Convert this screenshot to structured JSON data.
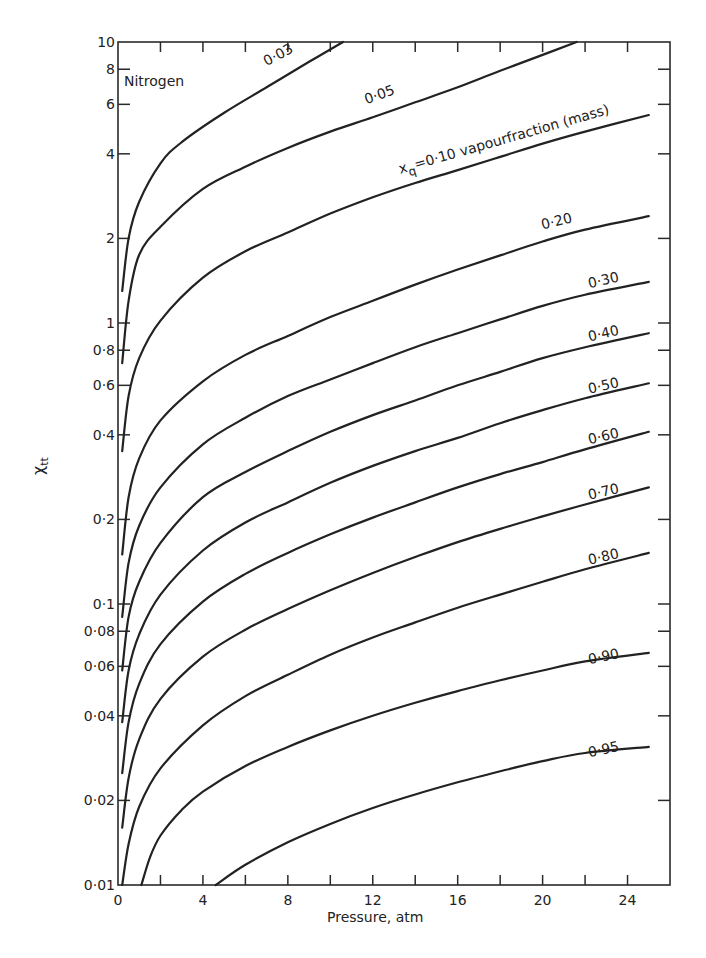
{
  "chart_data": {
    "type": "line",
    "title": "",
    "annotation": "Nitrogen",
    "xlabel": "Pressure, atm",
    "ylabel": "χtt",
    "ylabel_main": "χ",
    "ylabel_sub": "tt",
    "xscale": "linear",
    "yscale": "log",
    "xlim": [
      0,
      26
    ],
    "ylim": [
      0.01,
      10
    ],
    "grid": false,
    "legend_position": "inline labels at curve ends",
    "x_ticks": [
      0,
      2,
      4,
      6,
      8,
      10,
      12,
      14,
      16,
      18,
      20,
      22,
      24
    ],
    "x_tick_labels": [
      {
        "value": 0,
        "label": "0"
      },
      {
        "value": 4,
        "label": "4"
      },
      {
        "value": 8,
        "label": "8"
      },
      {
        "value": 12,
        "label": "12"
      },
      {
        "value": 16,
        "label": "16"
      },
      {
        "value": 20,
        "label": "20"
      },
      {
        "value": 24,
        "label": "24"
      }
    ],
    "y_ticks": [
      0.02,
      0.04,
      0.06,
      0.08,
      0.1,
      0.2,
      0.4,
      0.6,
      0.8,
      1,
      2,
      4,
      6,
      8
    ],
    "y_tick_labels": [
      {
        "value": 10,
        "label": "10"
      },
      {
        "value": 8,
        "label": "8"
      },
      {
        "value": 6,
        "label": "6"
      },
      {
        "value": 4,
        "label": "4"
      },
      {
        "value": 2,
        "label": "2"
      },
      {
        "value": 1,
        "label": "1"
      },
      {
        "value": 0.8,
        "label": "0·8"
      },
      {
        "value": 0.6,
        "label": "0·6"
      },
      {
        "value": 0.4,
        "label": "0·4"
      },
      {
        "value": 0.2,
        "label": "0·2"
      },
      {
        "value": 0.1,
        "label": "0·1"
      },
      {
        "value": 0.08,
        "label": "0·08"
      },
      {
        "value": 0.06,
        "label": "0·06"
      },
      {
        "value": 0.04,
        "label": "0·04"
      },
      {
        "value": 0.02,
        "label": "0·02"
      },
      {
        "value": 0.01,
        "label": "0·01"
      }
    ],
    "series": [
      {
        "name": "0·03",
        "label": "0·03",
        "label_pos": [
          7.0,
          8.2
        ],
        "label_angle": -28,
        "points": [
          [
            0.2,
            1.3
          ],
          [
            0.5,
            2.0
          ],
          [
            1.0,
            2.7
          ],
          [
            2.0,
            3.7
          ],
          [
            3.0,
            4.4
          ],
          [
            5.0,
            5.6
          ],
          [
            7.0,
            6.9
          ],
          [
            9.0,
            8.5
          ],
          [
            10.6,
            10
          ]
        ]
      },
      {
        "name": "0·05",
        "label": "0·05",
        "label_pos": [
          11.7,
          6.0
        ],
        "label_angle": -20,
        "points": [
          [
            0.2,
            0.72
          ],
          [
            0.5,
            1.2
          ],
          [
            1.0,
            1.75
          ],
          [
            2.0,
            2.2
          ],
          [
            4.0,
            3.0
          ],
          [
            6.0,
            3.6
          ],
          [
            8.0,
            4.2
          ],
          [
            10.0,
            4.8
          ],
          [
            12.0,
            5.4
          ],
          [
            14.0,
            6.1
          ],
          [
            16.0,
            6.9
          ],
          [
            18.0,
            7.9
          ],
          [
            20.0,
            9.0
          ],
          [
            21.6,
            10
          ]
        ]
      },
      {
        "name": "0·10",
        "label": "x_q=0·10 vapourfraction (mass)",
        "label_pos": [
          13.3,
          3.4
        ],
        "label_angle": -16,
        "points": [
          [
            0.2,
            0.35
          ],
          [
            0.5,
            0.55
          ],
          [
            1.0,
            0.75
          ],
          [
            2.0,
            1.02
          ],
          [
            4.0,
            1.45
          ],
          [
            6.0,
            1.8
          ],
          [
            8.0,
            2.1
          ],
          [
            10.0,
            2.45
          ],
          [
            12.0,
            2.8
          ],
          [
            14.0,
            3.15
          ],
          [
            16.0,
            3.5
          ],
          [
            18.0,
            3.9
          ],
          [
            20.0,
            4.35
          ],
          [
            22.0,
            4.8
          ],
          [
            25.0,
            5.5
          ]
        ]
      },
      {
        "name": "0·20",
        "label": "0·20",
        "label_pos": [
          20.0,
          2.15
        ],
        "label_angle": -14,
        "points": [
          [
            0.2,
            0.15
          ],
          [
            0.5,
            0.24
          ],
          [
            1.0,
            0.33
          ],
          [
            2.0,
            0.45
          ],
          [
            4.0,
            0.62
          ],
          [
            6.0,
            0.77
          ],
          [
            8.0,
            0.9
          ],
          [
            10.0,
            1.05
          ],
          [
            12.0,
            1.2
          ],
          [
            14.0,
            1.37
          ],
          [
            16.0,
            1.55
          ],
          [
            18.0,
            1.74
          ],
          [
            20.0,
            1.95
          ],
          [
            22.0,
            2.15
          ],
          [
            25.0,
            2.4
          ]
        ]
      },
      {
        "name": "0·30",
        "label": "0·30",
        "label_pos": [
          22.2,
          1.33
        ],
        "label_angle": -13,
        "points": [
          [
            0.2,
            0.09
          ],
          [
            0.5,
            0.14
          ],
          [
            1.0,
            0.19
          ],
          [
            2.0,
            0.26
          ],
          [
            4.0,
            0.37
          ],
          [
            6.0,
            0.46
          ],
          [
            8.0,
            0.55
          ],
          [
            10.0,
            0.63
          ],
          [
            12.0,
            0.72
          ],
          [
            14.0,
            0.82
          ],
          [
            16.0,
            0.92
          ],
          [
            18.0,
            1.03
          ],
          [
            20.0,
            1.15
          ],
          [
            22.0,
            1.26
          ],
          [
            25.0,
            1.4
          ]
        ]
      },
      {
        "name": "0·40",
        "label": "0·40",
        "label_pos": [
          22.2,
          0.86
        ],
        "label_angle": -13,
        "points": [
          [
            0.2,
            0.058
          ],
          [
            0.5,
            0.09
          ],
          [
            1.0,
            0.12
          ],
          [
            2.0,
            0.165
          ],
          [
            4.0,
            0.24
          ],
          [
            6.0,
            0.295
          ],
          [
            8.0,
            0.35
          ],
          [
            10.0,
            0.41
          ],
          [
            12.0,
            0.47
          ],
          [
            14.0,
            0.53
          ],
          [
            16.0,
            0.6
          ],
          [
            18.0,
            0.67
          ],
          [
            20.0,
            0.75
          ],
          [
            22.0,
            0.82
          ],
          [
            25.0,
            0.92
          ]
        ]
      },
      {
        "name": "0·50",
        "label": "0·50",
        "label_pos": [
          22.2,
          0.56
        ],
        "label_angle": -13,
        "points": [
          [
            0.2,
            0.038
          ],
          [
            0.5,
            0.058
          ],
          [
            1.0,
            0.078
          ],
          [
            2.0,
            0.108
          ],
          [
            4.0,
            0.155
          ],
          [
            6.0,
            0.195
          ],
          [
            8.0,
            0.23
          ],
          [
            10.0,
            0.27
          ],
          [
            12.0,
            0.31
          ],
          [
            14.0,
            0.35
          ],
          [
            16.0,
            0.39
          ],
          [
            18.0,
            0.44
          ],
          [
            20.0,
            0.49
          ],
          [
            22.0,
            0.54
          ],
          [
            25.0,
            0.61
          ]
        ]
      },
      {
        "name": "0·60",
        "label": "0·60",
        "label_pos": [
          22.2,
          0.37
        ],
        "label_angle": -13,
        "points": [
          [
            0.2,
            0.025
          ],
          [
            0.5,
            0.038
          ],
          [
            1.0,
            0.052
          ],
          [
            2.0,
            0.072
          ],
          [
            4.0,
            0.102
          ],
          [
            6.0,
            0.128
          ],
          [
            8.0,
            0.152
          ],
          [
            10.0,
            0.177
          ],
          [
            12.0,
            0.203
          ],
          [
            14.0,
            0.23
          ],
          [
            16.0,
            0.26
          ],
          [
            18.0,
            0.29
          ],
          [
            20.0,
            0.32
          ],
          [
            22.0,
            0.355
          ],
          [
            25.0,
            0.41
          ]
        ]
      },
      {
        "name": "0·70",
        "label": "0·70",
        "label_pos": [
          22.2,
          0.235
        ],
        "label_angle": -13,
        "points": [
          [
            0.2,
            0.016
          ],
          [
            0.5,
            0.024
          ],
          [
            1.0,
            0.033
          ],
          [
            2.0,
            0.046
          ],
          [
            4.0,
            0.065
          ],
          [
            6.0,
            0.081
          ],
          [
            8.0,
            0.096
          ],
          [
            10.0,
            0.112
          ],
          [
            12.0,
            0.129
          ],
          [
            14.0,
            0.147
          ],
          [
            16.0,
            0.166
          ],
          [
            18.0,
            0.185
          ],
          [
            20.0,
            0.205
          ],
          [
            22.0,
            0.226
          ],
          [
            25.0,
            0.26
          ]
        ]
      },
      {
        "name": "0·80",
        "label": "0·80",
        "label_pos": [
          22.2,
          0.138
        ],
        "label_angle": -13,
        "points": [
          [
            0.2,
            0.01
          ],
          [
            0.5,
            0.014
          ],
          [
            1.0,
            0.019
          ],
          [
            2.0,
            0.026
          ],
          [
            4.0,
            0.037
          ],
          [
            6.0,
            0.047
          ],
          [
            8.0,
            0.056
          ],
          [
            10.0,
            0.066
          ],
          [
            12.0,
            0.076
          ],
          [
            14.0,
            0.086
          ],
          [
            16.0,
            0.097
          ],
          [
            18.0,
            0.108
          ],
          [
            20.0,
            0.12
          ],
          [
            22.0,
            0.133
          ],
          [
            25.0,
            0.152
          ]
        ]
      },
      {
        "name": "0·90",
        "label": "0·90",
        "label_pos": [
          22.2,
          0.061
        ],
        "label_angle": -12,
        "points": [
          [
            1.1,
            0.01
          ],
          [
            1.5,
            0.0125
          ],
          [
            2.0,
            0.015
          ],
          [
            3.0,
            0.0185
          ],
          [
            4.0,
            0.0215
          ],
          [
            6.0,
            0.0265
          ],
          [
            8.0,
            0.031
          ],
          [
            10.0,
            0.0355
          ],
          [
            12.0,
            0.04
          ],
          [
            14.0,
            0.0445
          ],
          [
            16.0,
            0.049
          ],
          [
            18.0,
            0.0535
          ],
          [
            20.0,
            0.058
          ],
          [
            22.0,
            0.0625
          ],
          [
            25.0,
            0.067
          ]
        ]
      },
      {
        "name": "0·95",
        "label": "0·95",
        "label_pos": [
          22.2,
          0.0285
        ],
        "label_angle": -12,
        "points": [
          [
            4.6,
            0.01
          ],
          [
            6.0,
            0.0118
          ],
          [
            8.0,
            0.0142
          ],
          [
            10.0,
            0.0165
          ],
          [
            12.0,
            0.0188
          ],
          [
            14.0,
            0.021
          ],
          [
            16.0,
            0.0232
          ],
          [
            18.0,
            0.0254
          ],
          [
            20.0,
            0.0276
          ],
          [
            22.0,
            0.0295
          ],
          [
            25.0,
            0.031
          ]
        ]
      }
    ]
  },
  "plot_geometry": {
    "left": 118,
    "right": 670,
    "top": 42,
    "bottom": 885
  }
}
